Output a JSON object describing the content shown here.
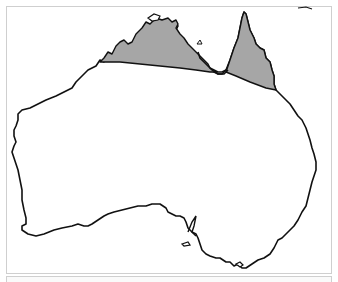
{
  "map": {
    "subject": "Australia",
    "highlighted_region": "Northern Australia (tropical north)",
    "colors": {
      "land": "#ffffff",
      "highlight": "#a6a6a6",
      "coastline": "#111111",
      "frame": "#cfcfcf",
      "background": "#ffffff"
    }
  }
}
